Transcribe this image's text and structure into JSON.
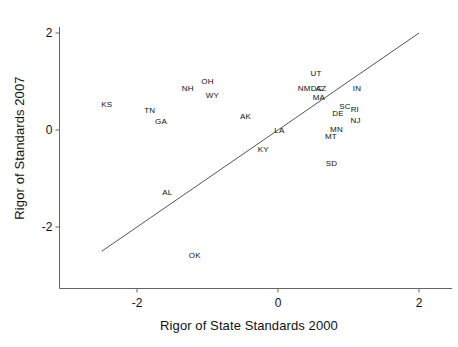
{
  "chart_data": {
    "type": "scatter",
    "title": "",
    "xlabel": "Rigor of State Standards 2000",
    "ylabel": "Rigor of Standards 2007",
    "xlim": [
      -3.0,
      2.35
    ],
    "ylim": [
      -3.2,
      2.35
    ],
    "xticks": [
      -2,
      0,
      2
    ],
    "xticklabels": [
      "-2",
      "0",
      "2"
    ],
    "yticks": [
      -2,
      0,
      2
    ],
    "yticklabels": [
      "-2",
      "0",
      "2"
    ],
    "grid": false,
    "legend": null,
    "point_marker": "text-label-only",
    "reference_line": {
      "name": "identity-line",
      "description": "y = x diagonal reference line",
      "x_start": -2.5,
      "y_start": -2.5,
      "x_end": 2.0,
      "y_end": 2.0,
      "color": "#555555"
    },
    "points": [
      {
        "label": "KS",
        "x": -2.43,
        "y": 0.52
      },
      {
        "label": "TN",
        "x": -1.82,
        "y": 0.4
      },
      {
        "label": "GA",
        "x": -1.66,
        "y": 0.17
      },
      {
        "label": "NH",
        "x": -1.28,
        "y": 0.85
      },
      {
        "label": "OH",
        "x": -1.0,
        "y": 1.0
      },
      {
        "label": "WY",
        "x": -0.93,
        "y": 0.71
      },
      {
        "label": "AK",
        "x": -0.46,
        "y": 0.27
      },
      {
        "label": "AL",
        "x": -1.57,
        "y": -1.29
      },
      {
        "label": "OK",
        "x": -1.18,
        "y": -2.6
      },
      {
        "label": "KY",
        "x": -0.21,
        "y": -0.42
      },
      {
        "label": "LA",
        "x": 0.02,
        "y": -0.03
      },
      {
        "label": "UT",
        "x": 0.54,
        "y": 1.15
      },
      {
        "label": "NM",
        "x": 0.37,
        "y": 0.85
      },
      {
        "label": "DC",
        "x": 0.55,
        "y": 0.85
      },
      {
        "label": "AZ",
        "x": 0.61,
        "y": 0.85
      },
      {
        "label": "MA",
        "x": 0.58,
        "y": 0.66
      },
      {
        "label": "IN",
        "x": 1.12,
        "y": 0.85
      },
      {
        "label": "SC",
        "x": 0.95,
        "y": 0.48
      },
      {
        "label": "RI",
        "x": 1.09,
        "y": 0.41
      },
      {
        "label": "DE",
        "x": 0.85,
        "y": 0.34
      },
      {
        "label": "NJ",
        "x": 1.1,
        "y": 0.19
      },
      {
        "label": "MN",
        "x": 0.83,
        "y": -0.01
      },
      {
        "label": "MT",
        "x": 0.75,
        "y": -0.15
      },
      {
        "label": "SD",
        "x": 0.76,
        "y": -0.71
      }
    ]
  },
  "axes": {
    "axis_color": "#666666",
    "text_color": "#111111"
  }
}
